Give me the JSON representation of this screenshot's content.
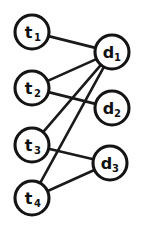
{
  "diagram": {
    "type": "bipartite-graph",
    "title": "",
    "left_group_label": "t",
    "right_group_label": "d",
    "node_radius": 17,
    "colors": {
      "node_fill": "#ffffff",
      "node_stroke": "#141414",
      "edge_stroke": "#1a1a1a",
      "label_color": "#111111",
      "background": "#ffffff"
    },
    "nodes": [
      {
        "id": "t1",
        "base": "t",
        "sub": "1",
        "x": 32,
        "y": 32,
        "side": "left"
      },
      {
        "id": "t2",
        "base": "t",
        "sub": "2",
        "x": 32,
        "y": 88,
        "side": "left"
      },
      {
        "id": "t3",
        "base": "t",
        "sub": "3",
        "x": 32,
        "y": 145,
        "side": "left"
      },
      {
        "id": "t4",
        "base": "t",
        "sub": "4",
        "x": 32,
        "y": 198,
        "side": "left"
      },
      {
        "id": "d1",
        "base": "d",
        "sub": "1",
        "x": 112,
        "y": 52,
        "side": "right"
      },
      {
        "id": "d2",
        "base": "d",
        "sub": "2",
        "x": 112,
        "y": 108,
        "side": "right"
      },
      {
        "id": "d3",
        "base": "d",
        "sub": "3",
        "x": 110,
        "y": 163,
        "side": "right"
      }
    ],
    "edges": [
      {
        "id": "t1-d1",
        "from": "t1",
        "to": "d1"
      },
      {
        "id": "t2-d1",
        "from": "t2",
        "to": "d1"
      },
      {
        "id": "t2-d2",
        "from": "t2",
        "to": "d2"
      },
      {
        "id": "t3-d1",
        "from": "t3",
        "to": "d1"
      },
      {
        "id": "t3-d3",
        "from": "t3",
        "to": "d3"
      },
      {
        "id": "t4-d1",
        "from": "t4",
        "to": "d1"
      },
      {
        "id": "t4-d3",
        "from": "t4",
        "to": "d3"
      }
    ]
  }
}
